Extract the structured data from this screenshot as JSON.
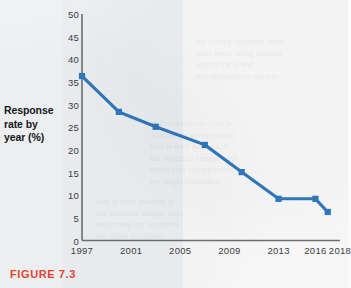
{
  "figure": {
    "caption": "FIGURE 7.3",
    "caption_color": "#e8442e"
  },
  "chart_data": {
    "type": "line",
    "title": "",
    "subtitle": "",
    "xlabel": "",
    "ylabel": "Response rate by year (%)",
    "ylabel_lines": [
      "Response",
      "rate by",
      "year (%)"
    ],
    "series_color": "#2e78bd",
    "marker_shape": "square",
    "grid": false,
    "legend": "none",
    "xlim": [
      1997,
      2018
    ],
    "ylim": [
      0,
      50
    ],
    "yticks": [
      0,
      5,
      10,
      15,
      20,
      25,
      30,
      35,
      40,
      45,
      50
    ],
    "ytick_labels": [
      "0",
      "5",
      "10",
      "15",
      "20",
      "25",
      "30",
      "35",
      "40",
      "45",
      "50"
    ],
    "xticks": [
      1997,
      2001,
      2005,
      2009,
      2013,
      2016,
      2018
    ],
    "xtick_labels": [
      "1997",
      "2001",
      "2005",
      "2009",
      "2013",
      "2016",
      "2018"
    ],
    "categories": [
      1997,
      2000,
      2003,
      2007,
      2010,
      2013,
      2016,
      2017
    ],
    "x": [
      1997,
      2000,
      2003,
      2007,
      2010,
      2013,
      2016,
      2017
    ],
    "values": [
      36.3,
      28.4,
      25.1,
      21.1,
      15.1,
      9.2,
      9.2,
      6.3
    ],
    "series": [
      {
        "name": "Response rate by year (%)",
        "color": "#2e78bd",
        "values": [
          36.3,
          28.4,
          25.1,
          21.1,
          15.1,
          9.2,
          9.2,
          6.3
        ]
      }
    ],
    "points": [
      {
        "x": 1997,
        "y": 36.3
      },
      {
        "x": 2000,
        "y": 28.4
      },
      {
        "x": 2003,
        "y": 25.1
      },
      {
        "x": 2007,
        "y": 21.1
      },
      {
        "x": 2010,
        "y": 15.1
      },
      {
        "x": 2013,
        "y": 9.2
      },
      {
        "x": 2016,
        "y": 9.2
      },
      {
        "x": 2017,
        "y": 6.3
      }
    ]
  },
  "background": {
    "ghost_text": [
      "the survey response rates",
      "have been falling steadily",
      "across the years",
      "and researchers need to",
      "account for nonresponse",
      "bias in their analysis of",
      "the collected sample data",
      "which may not represent",
      "the target population",
      "in a reliable manner"
    ]
  }
}
